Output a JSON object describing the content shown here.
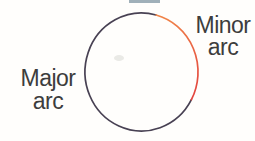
{
  "figure": {
    "background": "#fffefc",
    "text_color": "#3d3d3d",
    "minor_label": {
      "line1": "Minor",
      "line2": "arc"
    },
    "major_label": {
      "line1": "Major",
      "line2": "arc"
    },
    "circle": {
      "major_arc_color": "#484153",
      "minor_arc_color_start": "#f28c4a",
      "minor_arc_color_end": "#e3453f"
    },
    "artifact_color": "#8fa2ad",
    "smudge_color": "#d9d9d3"
  }
}
